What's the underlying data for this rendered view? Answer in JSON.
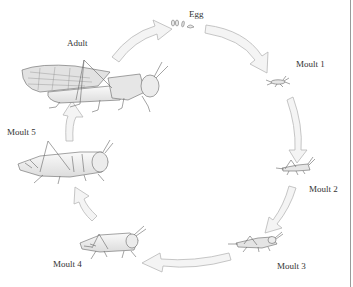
{
  "diagram": {
    "type": "life-cycle",
    "stages": [
      {
        "id": "egg",
        "label": "Egg"
      },
      {
        "id": "moult1",
        "label": "Moult 1"
      },
      {
        "id": "moult2",
        "label": "Moult 2"
      },
      {
        "id": "moult3",
        "label": "Moult 3"
      },
      {
        "id": "moult4",
        "label": "Moult 4"
      },
      {
        "id": "moult5",
        "label": "Moult 5"
      },
      {
        "id": "adult",
        "label": "Adult"
      }
    ],
    "flow": [
      "Egg",
      "Moult 1",
      "Moult 2",
      "Moult 3",
      "Moult 4",
      "Moult 5",
      "Adult",
      "Egg"
    ],
    "colors": {
      "arrow_fill": "#f4f4f4",
      "arrow_stroke": "#b8b8b8",
      "line_art": "#6a6a6a",
      "label": "#333333",
      "border": "#9a9a9a"
    }
  }
}
